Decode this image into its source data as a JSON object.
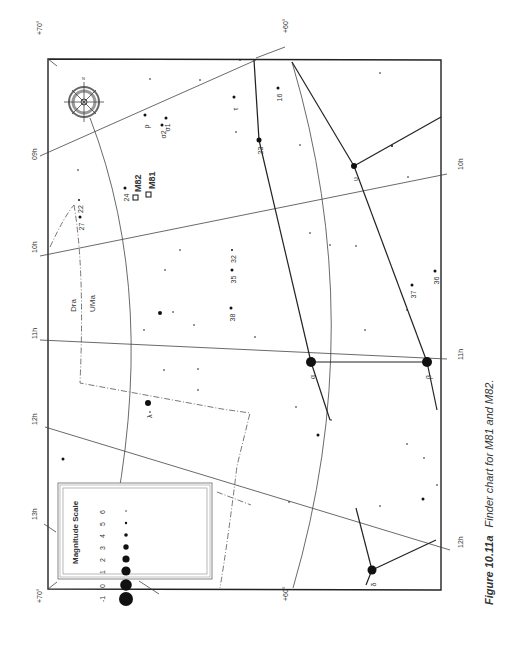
{
  "figure": {
    "number": "Figure 10.11a",
    "caption": "Finder chart for M81 and M82."
  },
  "grid_labels": {
    "ra": [
      {
        "text": "09h",
        "x": 37,
        "y": 160
      },
      {
        "text": "10h",
        "x": 37,
        "y": 253
      },
      {
        "text": "11h",
        "x": 37,
        "y": 339
      },
      {
        "text": "12h",
        "x": 37,
        "y": 425
      },
      {
        "text": "13h",
        "x": 37,
        "y": 520
      },
      {
        "text": "10h",
        "x": 463,
        "y": 170
      },
      {
        "text": "11h",
        "x": 463,
        "y": 360
      },
      {
        "text": "12h",
        "x": 463,
        "y": 548
      }
    ],
    "dec": [
      {
        "text": "+70°",
        "x": 42,
        "y": 35
      },
      {
        "text": "+60°",
        "x": 288,
        "y": 33
      },
      {
        "text": "+70°",
        "x": 42,
        "y": 603
      },
      {
        "text": "+60°",
        "x": 288,
        "y": 601
      }
    ]
  },
  "constellations": [
    {
      "name": "Dra",
      "x": 76,
      "y": 312
    },
    {
      "name": "UMa",
      "x": 95,
      "y": 308
    }
  ],
  "objects": [
    {
      "name": "M82",
      "x": 141,
      "y": 192
    },
    {
      "name": "M81",
      "x": 155,
      "y": 189
    }
  ],
  "stars": [
    {
      "label": "α",
      "x": 311,
      "y": 362,
      "r": 5
    },
    {
      "label": "β",
      "x": 427,
      "y": 362,
      "r": 5
    },
    {
      "label": "δ",
      "x": 372,
      "y": 570,
      "r": 4.5
    },
    {
      "label": "υ",
      "x": 354,
      "y": 166,
      "r": 3
    },
    {
      "label": "λ",
      "x": 148,
      "y": 403,
      "r": 3
    },
    {
      "label": "23",
      "x": 259,
      "y": 140,
      "r": 2.5
    },
    {
      "label": "ρ",
      "x": 145,
      "y": 115,
      "r": 1.5
    },
    {
      "label": "σ2",
      "x": 162,
      "y": 125,
      "r": 1.5
    },
    {
      "label": "σ1",
      "x": 166,
      "y": 118,
      "r": 1.5
    },
    {
      "label": "τ",
      "x": 234,
      "y": 97,
      "r": 1.5
    },
    {
      "label": "16",
      "x": 278,
      "y": 88,
      "r": 1.5
    },
    {
      "label": "24",
      "x": 125,
      "y": 188,
      "r": 1.5
    },
    {
      "label": "22",
      "x": 79,
      "y": 200,
      "r": 1
    },
    {
      "label": "27",
      "x": 80,
      "y": 217,
      "r": 1.5
    },
    {
      "label": "32",
      "x": 232,
      "y": 250,
      "r": 1
    },
    {
      "label": "35",
      "x": 232,
      "y": 270,
      "r": 1.5
    },
    {
      "label": "38",
      "x": 231,
      "y": 308,
      "r": 1.5
    },
    {
      "label": "37",
      "x": 412,
      "y": 285,
      "r": 1.5
    },
    {
      "label": "36",
      "x": 435,
      "y": 271,
      "r": 1.5
    },
    {
      "label": "",
      "x": 160,
      "y": 313,
      "r": 2
    },
    {
      "label": "",
      "x": 318,
      "y": 435,
      "r": 1.5
    },
    {
      "label": "",
      "x": 423,
      "y": 499,
      "r": 1.5
    },
    {
      "label": "",
      "x": 63,
      "y": 459,
      "r": 1.5
    },
    {
      "label": "",
      "x": 392,
      "y": 146,
      "r": 1
    },
    {
      "label": "",
      "x": 173,
      "y": 312,
      "r": 0.8
    },
    {
      "label": "",
      "x": 194,
      "y": 325,
      "r": 0.8
    },
    {
      "label": "",
      "x": 164,
      "y": 370,
      "r": 0.8
    },
    {
      "label": "",
      "x": 198,
      "y": 369,
      "r": 0.8
    },
    {
      "label": "",
      "x": 198,
      "y": 390,
      "r": 0.8
    },
    {
      "label": "",
      "x": 144,
      "y": 330,
      "r": 0.8
    },
    {
      "label": "",
      "x": 150,
      "y": 412,
      "r": 0.8
    },
    {
      "label": "",
      "x": 255,
      "y": 337,
      "r": 0.8
    },
    {
      "label": "",
      "x": 365,
      "y": 330,
      "r": 0.8
    },
    {
      "label": "",
      "x": 407,
      "y": 310,
      "r": 0.8
    },
    {
      "label": "",
      "x": 331,
      "y": 420,
      "r": 0.8
    },
    {
      "label": "",
      "x": 296,
      "y": 407,
      "r": 0.8
    },
    {
      "label": "",
      "x": 380,
      "y": 506,
      "r": 0.8
    },
    {
      "label": "",
      "x": 407,
      "y": 444,
      "r": 0.8
    },
    {
      "label": "",
      "x": 424,
      "y": 458,
      "r": 0.8
    },
    {
      "label": "",
      "x": 437,
      "y": 485,
      "r": 0.8
    },
    {
      "label": "",
      "x": 300,
      "y": 145,
      "r": 0.8
    },
    {
      "label": "",
      "x": 310,
      "y": 233,
      "r": 0.8
    },
    {
      "label": "",
      "x": 330,
      "y": 245,
      "r": 0.8
    },
    {
      "label": "",
      "x": 356,
      "y": 246,
      "r": 0.8
    },
    {
      "label": "",
      "x": 380,
      "y": 73,
      "r": 0.8
    },
    {
      "label": "",
      "x": 408,
      "y": 177,
      "r": 0.8
    },
    {
      "label": "",
      "x": 180,
      "y": 250,
      "r": 0.8
    },
    {
      "label": "",
      "x": 200,
      "y": 80,
      "r": 0.8
    },
    {
      "label": "",
      "x": 236,
      "y": 132,
      "r": 0.8
    },
    {
      "label": "",
      "x": 78,
      "y": 170,
      "r": 0.8
    },
    {
      "label": "",
      "x": 165,
      "y": 270,
      "r": 0.8
    },
    {
      "label": "",
      "x": 240,
      "y": 60,
      "r": 0.8
    },
    {
      "label": "",
      "x": 150,
      "y": 79,
      "r": 0.8
    },
    {
      "label": "",
      "x": 110,
      "y": 576,
      "r": 0.8
    },
    {
      "label": "",
      "x": 289,
      "y": 502,
      "r": 0.8
    }
  ],
  "magnitude_scale": {
    "title": "Magnitude Scale",
    "entries": [
      {
        "mag": "6",
        "r": 0.7
      },
      {
        "mag": "5",
        "r": 1.2
      },
      {
        "mag": "4",
        "r": 1.8
      },
      {
        "mag": "3",
        "r": 2.7
      },
      {
        "mag": "2",
        "r": 3.6
      },
      {
        "mag": "1",
        "r": 4.6
      },
      {
        "mag": "0",
        "r": 5.8
      },
      {
        "mag": "-1",
        "r": 7
      }
    ]
  },
  "compass": {
    "labels": [
      "N",
      "E",
      "S",
      "W"
    ]
  }
}
